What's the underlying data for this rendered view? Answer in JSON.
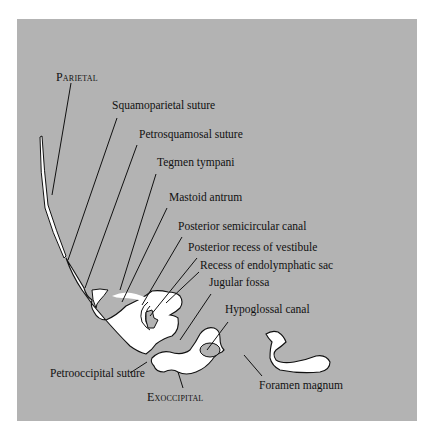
{
  "figure": {
    "background_color": "#b3b3b3",
    "bone_color": "#ffffff",
    "line_color": "#111111",
    "labels": {
      "parietal": "Parietal",
      "squamoparietal_suture": "Squamoparietal suture",
      "petrosquamosal_suture": "Petrosquamosal suture",
      "tegmen_tympani": "Tegmen tympani",
      "mastoid_antrum": "Mastoid antrum",
      "posterior_semicircular_canal": "Posterior semicircular canal",
      "posterior_recess_of_vestibule": "Posterior recess of vestibule",
      "recess_of_endolymphatic_sac": "Recess of endolymphatic sac",
      "jugular_fossa": "Jugular fossa",
      "hypoglossal_canal": "Hypoglossal canal",
      "petrooccipital_suture": "Petrooccipital suture",
      "exoccipital": "Exoccipital",
      "foramen_magnum": "Foramen magnum"
    }
  }
}
